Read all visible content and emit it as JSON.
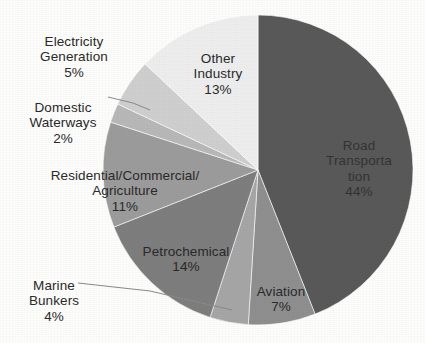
{
  "chart_data": {
    "type": "pie",
    "title": "",
    "subtitle": "",
    "xlabel": "",
    "ylabel": "",
    "legend_position": "none",
    "grid": false,
    "label_format": "name + percent",
    "start_angle_deg": 0,
    "direction": "clockwise",
    "total_percent": 100,
    "categories": [
      "Road Transportation",
      "Aviation",
      "Marine Bunkers",
      "Petrochemical",
      "Residential/Commercial/Agriculture",
      "Domestic Waterways",
      "Electricity Generation",
      "Other Industry"
    ],
    "values": [
      44,
      7,
      4,
      14,
      11,
      2,
      5,
      13
    ],
    "slices": [
      {
        "name": "Road Transportation",
        "value": 44,
        "percent_text": "44%",
        "color": "#595959",
        "label_lines": "Road\nTransporta\ntion",
        "label_placement": "inside",
        "leader_line": false
      },
      {
        "name": "Aviation",
        "value": 7,
        "percent_text": "7%",
        "color": "#8f8f8f",
        "label_lines": "Aviation",
        "label_placement": "inside",
        "leader_line": false
      },
      {
        "name": "Marine Bunkers",
        "value": 4,
        "percent_text": "4%",
        "color": "#a6a6a6",
        "label_lines": "Marine\nBunkers",
        "label_placement": "outside",
        "leader_line": true
      },
      {
        "name": "Petrochemical",
        "value": 14,
        "percent_text": "14%",
        "color": "#7e7e7e",
        "label_lines": "Petrochemical",
        "label_placement": "inside",
        "leader_line": false
      },
      {
        "name": "Residential/Commercial/Agriculture",
        "value": 11,
        "percent_text": "11%",
        "color": "#9c9c9c",
        "label_lines": "Residential/Commercial/\nAgriculture",
        "label_placement": "outside",
        "leader_line": false
      },
      {
        "name": "Domestic Waterways",
        "value": 2,
        "percent_text": "2%",
        "color": "#b8b8b8",
        "label_lines": "Domestic\nWaterways",
        "label_placement": "outside",
        "leader_line": true
      },
      {
        "name": "Electricity Generation",
        "value": 5,
        "percent_text": "5%",
        "color": "#cfcfcf",
        "label_lines": "Electricity\nGeneration",
        "label_placement": "outside",
        "leader_line": false
      },
      {
        "name": "Other Industry",
        "value": 13,
        "percent_text": "13%",
        "color": "#eeeeee",
        "label_lines": "Other\nIndustry",
        "label_placement": "inside",
        "leader_line": false
      }
    ]
  },
  "labels": {
    "electricity": {
      "name": "Electricity\nGeneration",
      "pct": "5%"
    },
    "domestic": {
      "name": "Domestic\nWaterways",
      "pct": "2%"
    },
    "residential": {
      "name": "Residential/Commercial/\nAgriculture",
      "pct": "11%"
    },
    "petrochemical": {
      "name": "Petrochemical",
      "pct": "14%"
    },
    "marine": {
      "name": "Marine\nBunkers",
      "pct": "4%"
    },
    "other_industry": {
      "name": "Other\nIndustry",
      "pct": "13%"
    },
    "road": {
      "name": "Road\nTransporta\ntion",
      "pct": "44%"
    },
    "aviation": {
      "name": "Aviation",
      "pct": "7%"
    }
  },
  "geometry": {
    "center_x": 258,
    "center_y": 170,
    "radius": 155
  }
}
